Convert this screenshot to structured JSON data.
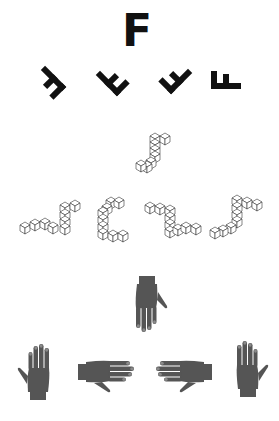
{
  "figure": {
    "type": "mental-rotation-stimuli",
    "sections": [
      {
        "id": "letters",
        "target": {
          "glyph": "F",
          "rotation_deg": 0
        },
        "options": [
          {
            "glyph": "F",
            "rotation_deg": 135,
            "mirrored": false
          },
          {
            "glyph": "F",
            "rotation_deg": 135,
            "mirrored": true
          },
          {
            "glyph": "F",
            "rotation_deg": -135,
            "mirrored": false
          },
          {
            "glyph": "F",
            "rotation_deg": 180,
            "mirrored": true
          }
        ]
      },
      {
        "id": "cube-figures",
        "target": {
          "shape": "cube-arm-figure"
        },
        "options": [
          {
            "shape": "cube-arm-figure"
          },
          {
            "shape": "cube-arm-figure"
          },
          {
            "shape": "cube-arm-figure"
          },
          {
            "shape": "cube-arm-figure"
          }
        ]
      },
      {
        "id": "hands",
        "target": {
          "hand": "back",
          "orientation": "fingers-down"
        },
        "options": [
          {
            "hand": "palm",
            "orientation": "fingers-up"
          },
          {
            "hand": "back",
            "orientation": "fingers-right"
          },
          {
            "hand": "back",
            "orientation": "fingers-left"
          },
          {
            "hand": "palm",
            "orientation": "fingers-up"
          }
        ]
      }
    ],
    "colors": {
      "ink": "#111111",
      "hand": "#555555",
      "nail": "#8a8a8a",
      "cube_stroke": "#333333",
      "background": "#ffffff"
    }
  }
}
